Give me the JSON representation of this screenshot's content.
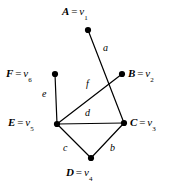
{
  "figure": {
    "width": 174,
    "height": 184,
    "background": "#ffffff",
    "ink_color": "#000000"
  },
  "graph": {
    "vertices": [
      {
        "id": "A",
        "name": "A",
        "alias": "v",
        "subscript": "1",
        "eq": "=",
        "x": 88,
        "y": 30,
        "label_x": 62,
        "label_y": 6,
        "label_align": "block"
      },
      {
        "id": "B",
        "name": "B",
        "alias": "v",
        "subscript": "2",
        "eq": "=",
        "x": 122,
        "y": 74,
        "label_x": 128,
        "label_y": 68,
        "label_align": "block"
      },
      {
        "id": "C",
        "name": "C",
        "alias": "v",
        "subscript": "3",
        "eq": "=",
        "x": 124,
        "y": 123,
        "label_x": 130,
        "label_y": 117,
        "label_align": "block"
      },
      {
        "id": "D",
        "name": "D",
        "alias": "v",
        "subscript": "4",
        "eq": "=",
        "x": 91,
        "y": 158,
        "label_x": 66,
        "label_y": 167,
        "label_align": "block"
      },
      {
        "id": "E",
        "name": "E",
        "alias": "v",
        "subscript": "5",
        "eq": "=",
        "x": 57,
        "y": 124,
        "label_x": 8,
        "label_y": 117,
        "label_align": "block"
      },
      {
        "id": "F",
        "name": "F",
        "alias": "v",
        "subscript": "6",
        "eq": "=",
        "x": 55,
        "y": 74,
        "label_x": 6,
        "label_y": 68,
        "label_align": "block"
      }
    ],
    "vertex_dot_radius": 3.1,
    "edges": [
      {
        "id": "a",
        "label": "a",
        "from": "A",
        "to": "C",
        "label_x": 103,
        "label_y": 43
      },
      {
        "id": "b",
        "label": "b",
        "from": "C",
        "to": "D",
        "label_x": 110,
        "label_y": 143
      },
      {
        "id": "c",
        "label": "c",
        "from": "E",
        "to": "D",
        "label_x": 63,
        "label_y": 143
      },
      {
        "id": "d",
        "label": "d",
        "from": "E",
        "to": "C",
        "label_x": 85,
        "label_y": 108
      },
      {
        "id": "e",
        "label": "e",
        "from": "F",
        "to": "E",
        "label_x": 42,
        "label_y": 89
      },
      {
        "id": "f",
        "label": "f",
        "from": "E",
        "to": "B",
        "label_x": 86,
        "label_y": 79
      }
    ],
    "edge_stroke_width": 1.2,
    "crossing_note": "Edge a (A-C) crosses edge f (E-B)"
  }
}
